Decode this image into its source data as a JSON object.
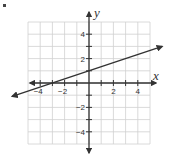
{
  "chart_data": {
    "type": "line",
    "title": "",
    "xlabel": "x",
    "ylabel": "y",
    "xlim": [
      -5,
      5
    ],
    "ylim": [
      -5,
      5
    ],
    "grid": true,
    "x_ticks": [
      -4,
      -2,
      2,
      4
    ],
    "y_ticks": [
      4,
      2,
      -2,
      -4
    ],
    "x_tick_labels": [
      "−4",
      "−2",
      "2",
      "4"
    ],
    "y_tick_labels": [
      "4",
      "2",
      "−2",
      "−4"
    ],
    "series": [
      {
        "name": "line",
        "equation": "y = (1/3)x + 1",
        "slope": 0.3333,
        "intercept": 1,
        "x": [
          -6.3,
          -3,
          0,
          3,
          6
        ],
        "y": [
          -1.1,
          0,
          1,
          2,
          3
        ],
        "arrows": "both"
      }
    ]
  },
  "colors": {
    "grid": "#d0d0d0",
    "axis": "#333333",
    "line": "#333333",
    "text": "#333333"
  }
}
